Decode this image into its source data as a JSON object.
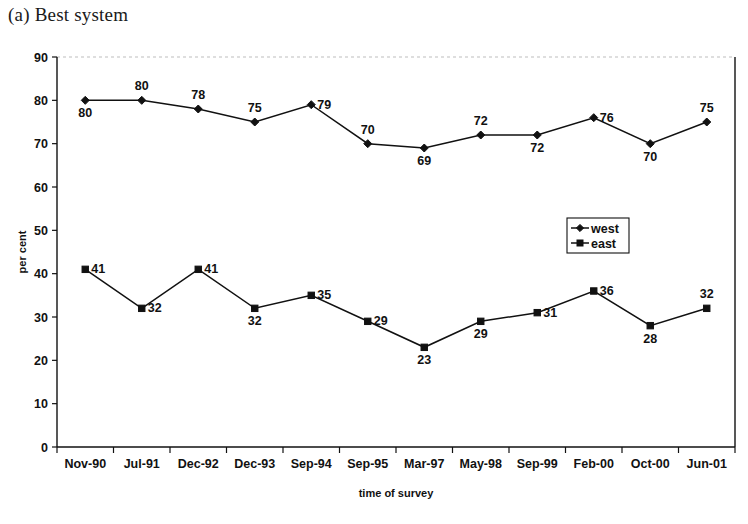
{
  "figure": {
    "caption": "(a) Best system"
  },
  "chart_data": {
    "type": "line",
    "title": "(a) Best system",
    "xlabel": "time of survey",
    "ylabel": "per cent",
    "categories": [
      "Nov-90",
      "Jul-91",
      "Dec-92",
      "Dec-93",
      "Sep-94",
      "Sep-95",
      "Mar-97",
      "May-98",
      "Sep-99",
      "Feb-00",
      "Oct-00",
      "Jun-01"
    ],
    "series": [
      {
        "name": "west",
        "marker": "diamond",
        "values": [
          80,
          80,
          78,
          75,
          79,
          70,
          69,
          72,
          72,
          76,
          70,
          75
        ],
        "label_positions": [
          "below",
          "above",
          "above",
          "above",
          "right",
          "above",
          "below",
          "above",
          "below",
          "right",
          "below",
          "above"
        ]
      },
      {
        "name": "east",
        "marker": "square",
        "values": [
          41,
          32,
          41,
          32,
          35,
          29,
          23,
          29,
          31,
          36,
          28,
          32
        ],
        "label_positions": [
          "right",
          "right",
          "right",
          "below",
          "right",
          "right",
          "below",
          "below",
          "right",
          "right",
          "below",
          "above"
        ]
      }
    ],
    "ylim": [
      0,
      90
    ],
    "yticks": [
      0,
      10,
      20,
      30,
      40,
      50,
      60,
      70,
      80,
      90
    ],
    "ytick_labels": [
      "0",
      "10",
      "20",
      "30",
      "40",
      "50",
      "60",
      "70",
      "80",
      "90"
    ],
    "grid": false,
    "legend_position": "center-right",
    "legend_entries": [
      "west",
      "east"
    ],
    "colors": {
      "line": "#111111",
      "marker": "#111111",
      "axis": "#111111",
      "background": "#ffffff"
    }
  }
}
